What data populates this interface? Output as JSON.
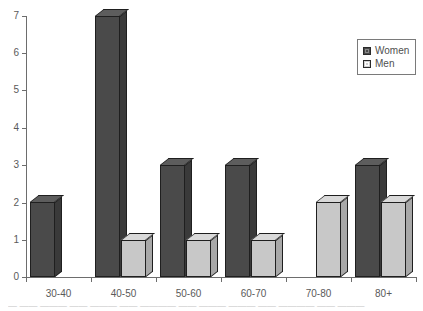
{
  "chart_data": {
    "type": "bar",
    "title": "",
    "subtitle": "",
    "xlabel": "",
    "ylabel": "",
    "categories": [
      "30-40",
      "40-50",
      "50-60",
      "60-70",
      "70-80",
      "80+"
    ],
    "series": [
      {
        "name": "Women",
        "color": "#4a4a4a",
        "values": [
          2,
          7,
          3,
          3,
          0,
          3
        ]
      },
      {
        "name": "Men",
        "color": "#c8c8c8",
        "values": [
          0,
          1,
          1,
          1,
          2,
          2
        ]
      }
    ],
    "ylim": [
      0,
      7
    ],
    "y_ticks": [
      0,
      1,
      2,
      3,
      4,
      5,
      6,
      7
    ],
    "y_tick_labels": [
      "0",
      "1",
      "2",
      "3",
      "4",
      "5",
      "6",
      "7"
    ],
    "grid": false,
    "legend_position": "top-right",
    "style": "3d-bars"
  },
  "legend": {
    "entries": [
      {
        "label": "Women",
        "swatch": "women-swatch-icon"
      },
      {
        "label": "Men",
        "swatch": "men-swatch-icon"
      }
    ]
  },
  "axes": {
    "y_labels": [
      "7",
      "6",
      "5",
      "4",
      "3",
      "2",
      "1",
      "0"
    ],
    "x_labels": [
      "30-40",
      "40-50",
      "50-60",
      "60-70",
      "70-80",
      "80+"
    ]
  },
  "caption": {
    "text": "— —— ——— —— ——— —— ———— —— ——— ——— —— ———— —— ———"
  }
}
